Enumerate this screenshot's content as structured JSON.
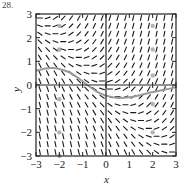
{
  "figure": {
    "corner_label": "28."
  },
  "chart_data": {
    "type": "slope_field",
    "title": "",
    "xlabel": "x",
    "ylabel": "y",
    "xlim": [
      -3,
      3
    ],
    "ylim": [
      -3,
      3
    ],
    "x_ticks": [
      -3,
      -2,
      -1,
      0,
      1,
      2,
      3
    ],
    "y_ticks": [
      -3,
      -2,
      -1,
      0,
      1,
      2,
      3
    ],
    "x_tick_labels": [
      "−3",
      "−2",
      "−1",
      "0",
      "1",
      "2",
      "3"
    ],
    "y_tick_labels": [
      "−3",
      "−2",
      "−1",
      "0",
      "1",
      "2",
      "3"
    ],
    "grid": false,
    "field": {
      "description": "Direction field: steep positive slopes in quadrant I, steep negative slopes in quadrant III, near-horizontal slopes in quadrants II and IV",
      "approx_equation": "dy/dx ≈ x + y",
      "grid_step": 0.3333,
      "segment_length": 0.22
    },
    "solution_curve": {
      "color": "#9a9a9a",
      "points": [
        [
          -3.0,
          0.6
        ],
        [
          -2.6,
          0.7
        ],
        [
          -2.3,
          0.72
        ],
        [
          -2.0,
          0.68
        ],
        [
          -1.6,
          0.55
        ],
        [
          -1.2,
          0.3
        ],
        [
          -0.8,
          0.0
        ],
        [
          -0.4,
          -0.28
        ],
        [
          0.0,
          -0.45
        ],
        [
          0.5,
          -0.55
        ],
        [
          1.0,
          -0.52
        ],
        [
          1.5,
          -0.42
        ],
        [
          2.0,
          -0.3
        ],
        [
          2.5,
          -0.2
        ],
        [
          3.0,
          -0.1
        ]
      ]
    },
    "markers": {
      "color": "#a0a0a0",
      "points": [
        [
          -2.0,
          2.5
        ],
        [
          -2.0,
          1.5
        ],
        [
          -2.0,
          -0.6
        ],
        [
          -2.0,
          -2.0
        ],
        [
          -2.0,
          -3.0
        ],
        [
          2.0,
          2.5
        ],
        [
          2.0,
          1.5
        ],
        [
          2.0,
          0.4
        ],
        [
          2.0,
          -0.8
        ],
        [
          2.0,
          -2.0
        ]
      ]
    }
  },
  "colors": {
    "axis": "#222222",
    "field": "#1a1a1a",
    "curve": "#9a9a9a",
    "background": "#ffffff"
  }
}
